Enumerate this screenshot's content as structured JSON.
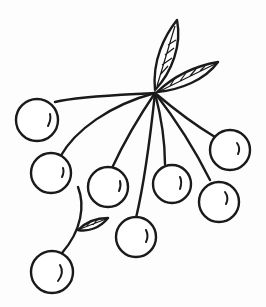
{
  "illustration": {
    "subject": "berry-cluster-line-drawing",
    "stroke_color": "#1a1a1a",
    "background_color": "#fdfdfd",
    "berry_count": 9,
    "leaf_count": 3
  }
}
